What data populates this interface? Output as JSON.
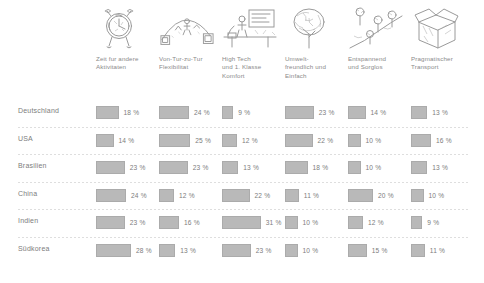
{
  "chart_data": {
    "type": "bar",
    "title": "",
    "xlabel": "",
    "ylabel": "",
    "orientation": "horizontal",
    "unit": "%",
    "value_suffix": " %",
    "max_value": 31,
    "grid": false,
    "legend": "none",
    "categories": [
      "Zeit fur andere Aktivitaten",
      "Von-Tur-zu-Tur Flexibilitat",
      "High Tech und 1. Klasse Komfort",
      "Umwelt-freundlich und Einfach",
      "Entspannend und Sorglos",
      "Pragmatischer Transport"
    ],
    "series": [
      {
        "name": "Deutschland",
        "values": [
          18,
          24,
          9,
          23,
          14,
          13
        ]
      },
      {
        "name": "USA",
        "values": [
          14,
          25,
          12,
          22,
          10,
          16
        ]
      },
      {
        "name": "Brasilien",
        "values": [
          23,
          23,
          13,
          18,
          10,
          13
        ]
      },
      {
        "name": "China",
        "values": [
          24,
          12,
          22,
          11,
          20,
          10
        ]
      },
      {
        "name": "Indien",
        "values": [
          23,
          16,
          31,
          10,
          12,
          9
        ]
      },
      {
        "name": "Südkorea",
        "values": [
          28,
          13,
          23,
          10,
          15,
          11
        ]
      }
    ]
  },
  "columns": [
    {
      "icon": "alarm-clock-icon",
      "line1": "Zeit fur andere",
      "line2": "Aktivitaten",
      "line3": ""
    },
    {
      "icon": "door-to-door-icon",
      "line1": "Von-Tur-zu-Tur",
      "line2": "Flexibilitat",
      "line3": ""
    },
    {
      "icon": "high-tech-desk-icon",
      "line1": "High Tech",
      "line2": "und 1. Klasse",
      "line3": "Komfort"
    },
    {
      "icon": "tree-icon",
      "line1": "Umwelt-",
      "line2": "freundlich und",
      "line3": "Einfach"
    },
    {
      "icon": "relaxing-nature-icon",
      "line1": "Entspannend",
      "line2": "und Sorglos",
      "line3": ""
    },
    {
      "icon": "cardboard-box-icon",
      "line1": "Pragmatischer",
      "line2": "Transport",
      "line3": ""
    }
  ],
  "rows": [
    {
      "label": "Deutschland",
      "cells": [
        {
          "value": "18 %"
        },
        {
          "value": "24 %"
        },
        {
          "value": "9 %"
        },
        {
          "value": "23 %"
        },
        {
          "value": "14 %"
        },
        {
          "value": "13 %"
        }
      ]
    },
    {
      "label": "USA",
      "cells": [
        {
          "value": "14 %"
        },
        {
          "value": "25 %"
        },
        {
          "value": "12 %"
        },
        {
          "value": "22 %"
        },
        {
          "value": "10 %"
        },
        {
          "value": "16 %"
        }
      ]
    },
    {
      "label": "Brasilien",
      "cells": [
        {
          "value": "23 %"
        },
        {
          "value": "23 %"
        },
        {
          "value": "13 %"
        },
        {
          "value": "18 %"
        },
        {
          "value": "10 %"
        },
        {
          "value": "13 %"
        }
      ]
    },
    {
      "label": "China",
      "cells": [
        {
          "value": "24 %"
        },
        {
          "value": "12 %"
        },
        {
          "value": "22 %"
        },
        {
          "value": "11 %"
        },
        {
          "value": "20 %"
        },
        {
          "value": "10 %"
        }
      ]
    },
    {
      "label": "Indien",
      "cells": [
        {
          "value": "23 %"
        },
        {
          "value": "16 %"
        },
        {
          "value": "31 %"
        },
        {
          "value": "10 %"
        },
        {
          "value": "12 %"
        },
        {
          "value": "9 %"
        }
      ]
    },
    {
      "label": "Südkorea",
      "cells": [
        {
          "value": "28 %"
        },
        {
          "value": "13 %"
        },
        {
          "value": "23 %"
        },
        {
          "value": "10 %"
        },
        {
          "value": "15 %"
        },
        {
          "value": "11 %"
        }
      ]
    }
  ],
  "colors": {
    "bar_fill": "#b9b9b9",
    "bar_stroke": "#ababab",
    "text": "#7d7d7d",
    "separator": "#d8d8d8",
    "background": "#ffffff",
    "sketch_ink": "#9a9a9a"
  }
}
